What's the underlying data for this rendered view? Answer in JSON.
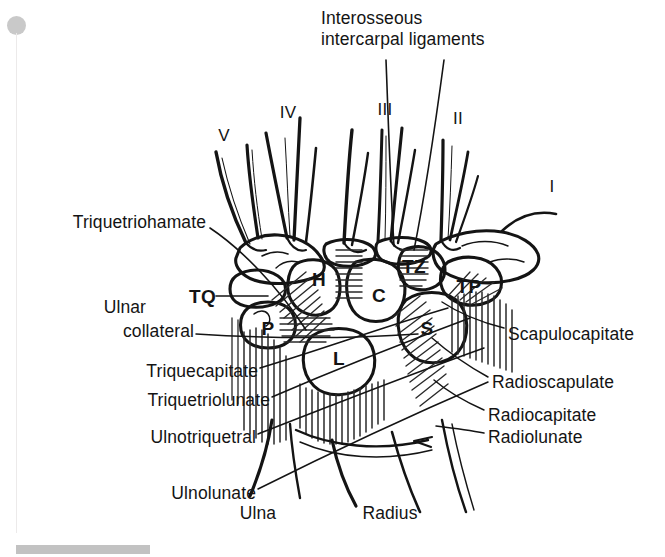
{
  "figure": {
    "kind": "anatomical-line-drawing",
    "background_color": "#ffffff",
    "ink_color": "#141414",
    "accent_gray": "#c9c9c9"
  },
  "title": {
    "line1": "Interosseous",
    "line2": "intercarpal ligaments"
  },
  "metacarpals": [
    {
      "id": "mc-v",
      "label": "V",
      "x": 224,
      "y": 139
    },
    {
      "id": "mc-iv",
      "label": "IV",
      "x": 288,
      "y": 116
    },
    {
      "id": "mc-iii",
      "label": "III",
      "x": 385,
      "y": 113
    },
    {
      "id": "mc-ii",
      "label": "II",
      "x": 458,
      "y": 122
    },
    {
      "id": "mc-i",
      "label": "I",
      "x": 552,
      "y": 190
    }
  ],
  "carpal_bones": [
    {
      "id": "bone-h",
      "label": "H",
      "name": "hamate",
      "x": 319,
      "y": 280
    },
    {
      "id": "bone-tz",
      "label": "TZ",
      "name": "trapezoid",
      "x": 412,
      "y": 267
    },
    {
      "id": "bone-tp",
      "label": "TP",
      "name": "trapezium",
      "x": 467,
      "y": 287
    },
    {
      "id": "bone-c",
      "label": "C",
      "name": "capitate",
      "x": 379,
      "y": 296
    },
    {
      "id": "bone-s",
      "label": "S",
      "name": "scaphoid",
      "x": 427,
      "y": 329
    },
    {
      "id": "bone-p",
      "label": "P",
      "name": "pisiform",
      "x": 268,
      "y": 329
    },
    {
      "id": "bone-l",
      "label": "L",
      "name": "lunate",
      "x": 339,
      "y": 359
    },
    {
      "id": "bone-tq",
      "label": "TQ",
      "name": "triquetrum",
      "x": 201,
      "y": 297
    }
  ],
  "ligament_labels_left": [
    {
      "id": "lig-triquetriohamate",
      "label": "Triquetriohamate",
      "x": 204,
      "y": 222
    },
    {
      "id": "lig-ulnar-collateral-l1",
      "label": "Ulnar",
      "x": 120,
      "y": 307
    },
    {
      "id": "lig-ulnar-collateral-l2",
      "label": "collateral",
      "x": 148,
      "y": 331
    },
    {
      "id": "lig-triquecapitate",
      "label": "Triquecapitate",
      "x": 188,
      "y": 371
    },
    {
      "id": "lig-triquetriolunate",
      "label": "Triquetriolunate",
      "x": 199,
      "y": 400
    },
    {
      "id": "lig-ulnotriquetral",
      "label": "Ulnotriquetral",
      "x": 186,
      "y": 437
    },
    {
      "id": "lig-ulnolunate",
      "label": "Ulnolunate",
      "x": 188,
      "y": 493
    }
  ],
  "ligament_labels_right": [
    {
      "id": "lig-scapulocapitate",
      "label": "Scapulocapitate",
      "x": 510,
      "y": 334
    },
    {
      "id": "lig-radioscapulate",
      "label": "Radioscapulate",
      "x": 495,
      "y": 382
    },
    {
      "id": "lig-radiocapitate",
      "label": "Radiocapitate",
      "x": 491,
      "y": 415
    },
    {
      "id": "lig-radiolunate",
      "label": "Radiolunate",
      "x": 491,
      "y": 437
    }
  ],
  "forearm_bones": [
    {
      "id": "bone-ulna",
      "label": "Ulna",
      "x": 258,
      "y": 513
    },
    {
      "id": "bone-radius",
      "label": "Radius",
      "x": 390,
      "y": 513
    }
  ]
}
